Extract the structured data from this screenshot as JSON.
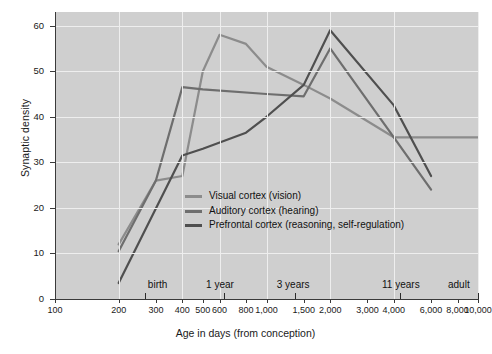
{
  "chart_data": {
    "type": "line",
    "title": "",
    "xlabel": "Age in days (from conception)",
    "ylabel": "Synaptic density",
    "xscale": "log",
    "xlim": [
      100,
      10000
    ],
    "ylim": [
      0,
      63
    ],
    "grid": true,
    "legend_position": "inside-center",
    "x_tick_labels": [
      "100",
      "200",
      "300",
      "400",
      "500",
      "600",
      "800",
      "1,000",
      "1,500",
      "2,000",
      "3,000",
      "4,000",
      "6,000",
      "8,000",
      "10,000"
    ],
    "x_tick_values": [
      100,
      200,
      300,
      400,
      500,
      600,
      800,
      1000,
      1500,
      2000,
      3000,
      4000,
      6000,
      8000,
      10000
    ],
    "y_tick_labels": [
      "0",
      "10",
      "20",
      "30",
      "40",
      "50",
      "60"
    ],
    "y_tick_values": [
      0,
      10,
      20,
      30,
      40,
      50,
      60
    ],
    "annotations": [
      {
        "label": "birth",
        "x": 266
      },
      {
        "label": "1 year",
        "x": 630
      },
      {
        "label": "3 years",
        "x": 1360
      },
      {
        "label": "11 years",
        "x": 4280
      },
      {
        "label": "adult",
        "x": 10000
      }
    ],
    "series": [
      {
        "name": "Visual cortex (vision)",
        "color": "#8c8c8c",
        "x": [
          200,
          300,
          400,
          500,
          600,
          800,
          1000,
          1500,
          2000,
          4000,
          6000,
          10000
        ],
        "y": [
          12,
          26,
          27,
          50,
          58,
          56,
          51,
          47,
          44,
          35.5,
          35.5,
          35.5
        ]
      },
      {
        "name": "Auditory cortex (hearing)",
        "color": "#6e6e6e",
        "x": [
          200,
          300,
          400,
          500,
          1000,
          1500,
          2000,
          4000,
          6000
        ],
        "y": [
          10.5,
          26,
          46.5,
          46,
          45,
          44.5,
          55,
          35.5,
          24
        ]
      },
      {
        "name": "Prefrontal cortex (reasoning, self-regulation)",
        "color": "#4f4f4f",
        "x": [
          200,
          400,
          500,
          800,
          1000,
          1500,
          2000,
          4000,
          6000
        ],
        "y": [
          3.5,
          31.5,
          33,
          36.5,
          40,
          47,
          59,
          42.5,
          27
        ]
      }
    ]
  },
  "legend": {
    "items": [
      {
        "label": "Visual cortex (vision)"
      },
      {
        "label": "Auditory cortex (hearing)"
      },
      {
        "label": "Prefrontal cortex (reasoning, self-regulation)"
      }
    ]
  },
  "axes": {
    "y_title": "Synaptic density",
    "x_title": "Age in days (from conception)"
  }
}
